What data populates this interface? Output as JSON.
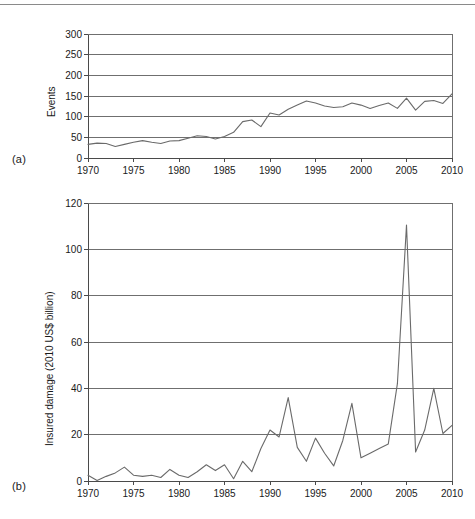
{
  "figure": {
    "panel_a_tag": "(a)",
    "panel_b_tag": "(b)"
  },
  "chart_data": [
    {
      "id": "panel_a",
      "type": "line",
      "title": "",
      "xlabel": "",
      "ylabel": "Events",
      "xlim": [
        1970,
        2010
      ],
      "ylim": [
        0,
        300
      ],
      "yticks": [
        0,
        50,
        100,
        150,
        200,
        250,
        300
      ],
      "xticks": [
        1970,
        1975,
        1980,
        1985,
        1990,
        1995,
        2000,
        2005,
        2010
      ],
      "grid": true,
      "legend": "none",
      "line_color": "#6a6a6a",
      "x": [
        1970,
        1971,
        1972,
        1973,
        1974,
        1975,
        1976,
        1977,
        1978,
        1979,
        1980,
        1981,
        1982,
        1983,
        1984,
        1985,
        1986,
        1987,
        1988,
        1989,
        1990,
        1991,
        1992,
        1993,
        1994,
        1995,
        1996,
        1997,
        1998,
        1999,
        2000,
        2001,
        2002,
        2003,
        2004,
        2005,
        2006,
        2007,
        2008,
        2009,
        2010
      ],
      "values": [
        33,
        36,
        35,
        28,
        33,
        38,
        42,
        38,
        35,
        41,
        42,
        48,
        54,
        52,
        46,
        52,
        62,
        88,
        92,
        76,
        109,
        104,
        118,
        128,
        138,
        133,
        126,
        122,
        124,
        133,
        128,
        120,
        127,
        133,
        120,
        145,
        116,
        137,
        139,
        132,
        155
      ]
    },
    {
      "id": "panel_b",
      "type": "line",
      "title": "",
      "xlabel": "",
      "ylabel": "Insured damage (2010 US$ billion)",
      "xlim": [
        1970,
        2010
      ],
      "ylim": [
        0,
        120
      ],
      "yticks": [
        0,
        20,
        40,
        60,
        80,
        100,
        120
      ],
      "xticks": [
        1970,
        1975,
        1980,
        1985,
        1990,
        1995,
        2000,
        2005,
        2010
      ],
      "grid": true,
      "legend": "none",
      "line_color": "#6a6a6a",
      "x": [
        1970,
        1971,
        1972,
        1973,
        1974,
        1975,
        1976,
        1977,
        1978,
        1979,
        1980,
        1981,
        1982,
        1983,
        1984,
        1985,
        1986,
        1987,
        1988,
        1989,
        1990,
        1991,
        1992,
        1993,
        1994,
        1995,
        1996,
        1997,
        1998,
        1999,
        2000,
        2001,
        2002,
        2003,
        2004,
        2005,
        2006,
        2007,
        2008,
        2009,
        2010
      ],
      "values": [
        2.5,
        0.2,
        2.0,
        3.5,
        6.0,
        2.5,
        2.0,
        2.5,
        1.5,
        5.0,
        2.5,
        1.5,
        4.0,
        7.0,
        4.5,
        7.0,
        1.0,
        8.5,
        4.0,
        14.0,
        22.0,
        19.0,
        36.0,
        14.5,
        8.5,
        18.5,
        12.0,
        6.5,
        17.5,
        33.5,
        10.0,
        12.0,
        14.0,
        16.0,
        42.0,
        110.5,
        12.5,
        22.0,
        40.0,
        20.5,
        24.0
      ]
    }
  ]
}
